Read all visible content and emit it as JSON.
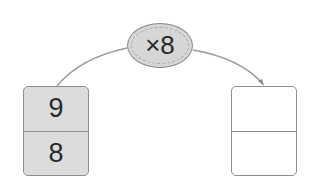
{
  "operator": {
    "label": "×8",
    "icon": "multiply-oval"
  },
  "input_box": {
    "top": "9",
    "bottom": "8"
  },
  "output_box": {
    "top": "",
    "bottom": ""
  },
  "colors": {
    "line": "#9a9a9a",
    "fill": "#dcdcdc",
    "border": "#8d8d8d"
  }
}
